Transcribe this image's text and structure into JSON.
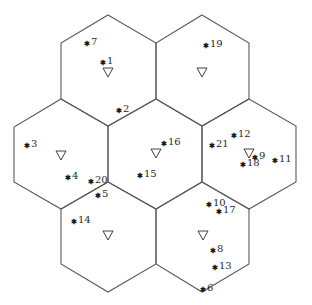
{
  "diagram": {
    "colors": {
      "cell_edge": "#5a5a5a",
      "marker": "#1a1a1a",
      "text": "#2a2a2a"
    },
    "cells": [
      {
        "id": "cell-top-left",
        "center": [
          108,
          70
        ],
        "points": "108,15 156,43 156,99 108,126 61,99 61,43"
      },
      {
        "id": "cell-top-right",
        "center": [
          202,
          70
        ],
        "points": "202,15 249,43 249,99 202,126 156,99 156,43"
      },
      {
        "id": "cell-mid-left",
        "center": [
          61,
          155
        ],
        "points": "61,99 108,126 108,182 61,209 14,182 14,127"
      },
      {
        "id": "cell-center",
        "center": [
          156,
          154
        ],
        "points": "156,99 202,126 202,182 156,209 108,182 108,126"
      },
      {
        "id": "cell-mid-right",
        "center": [
          249,
          154
        ],
        "points": "249,99 296,126 296,182 249,209 202,182 202,126"
      },
      {
        "id": "cell-bottom-left",
        "center": [
          108,
          237
        ],
        "points": "108,182 156,209 156,264 108,292 61,264 61,209"
      },
      {
        "id": "cell-bottom-right",
        "center": [
          202,
          237
        ],
        "points": "202,182 249,209 249,264 202,292 156,264 156,209"
      }
    ],
    "base_station_symbol": "▽",
    "base_stations": [
      {
        "x": 108,
        "y": 72
      },
      {
        "x": 202,
        "y": 72
      },
      {
        "x": 61,
        "y": 155
      },
      {
        "x": 156,
        "y": 153
      },
      {
        "x": 249,
        "y": 153
      },
      {
        "x": 108,
        "y": 235
      },
      {
        "x": 203,
        "y": 235
      }
    ],
    "user_symbol": "*",
    "users": [
      {
        "label": "1",
        "x": 106,
        "y": 60
      },
      {
        "label": "2",
        "x": 122,
        "y": 108
      },
      {
        "label": "3",
        "x": 30,
        "y": 143
      },
      {
        "label": "4",
        "x": 71,
        "y": 175
      },
      {
        "label": "5",
        "x": 101,
        "y": 193
      },
      {
        "label": "6",
        "x": 206,
        "y": 287
      },
      {
        "label": "7",
        "x": 90,
        "y": 41
      },
      {
        "label": "8",
        "x": 216,
        "y": 248
      },
      {
        "label": "9",
        "x": 258,
        "y": 155
      },
      {
        "label": "10",
        "x": 212,
        "y": 202
      },
      {
        "label": "11",
        "x": 278,
        "y": 158
      },
      {
        "label": "12",
        "x": 237,
        "y": 133
      },
      {
        "label": "13",
        "x": 218,
        "y": 265
      },
      {
        "label": "14",
        "x": 77,
        "y": 219
      },
      {
        "label": "15",
        "x": 143,
        "y": 173
      },
      {
        "label": "16",
        "x": 167,
        "y": 141
      },
      {
        "label": "17",
        "x": 222,
        "y": 209
      },
      {
        "label": "18",
        "x": 246,
        "y": 162
      },
      {
        "label": "19",
        "x": 209,
        "y": 43
      },
      {
        "label": "20",
        "x": 94,
        "y": 179
      },
      {
        "label": "21",
        "x": 215,
        "y": 143
      }
    ]
  }
}
